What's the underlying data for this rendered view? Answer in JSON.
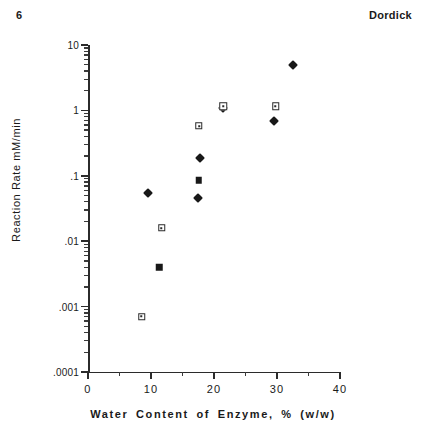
{
  "header": {
    "page_number": "6",
    "running_head": "Dordick"
  },
  "chart_data": {
    "type": "scatter",
    "title": "",
    "xlabel": "Water Content of Enzyme, % (w/w)",
    "ylabel": "Reaction Rate  mM/min",
    "xlim": [
      0,
      40
    ],
    "ylim": [
      0.0001,
      10
    ],
    "yscale": "log",
    "xscale": "linear",
    "grid": false,
    "legend": "none",
    "xticks": [
      0,
      10,
      20,
      30,
      40
    ],
    "xtick_labels": [
      "0",
      "10",
      "20",
      "30",
      "40"
    ],
    "xticks_minor": [
      5,
      15,
      25,
      35
    ],
    "yticks": [
      10,
      1,
      0.1,
      0.01,
      0.001,
      0.0001
    ],
    "ytick_labels": [
      "10",
      "1",
      ".1",
      ".01",
      ".001",
      ".0001"
    ],
    "series": [
      {
        "name": "filled-diamond",
        "marker": "filled-diamond",
        "points": [
          {
            "x": 9.5,
            "y": 0.055
          },
          {
            "x": 17.5,
            "y": 0.045
          },
          {
            "x": 17.8,
            "y": 0.19
          },
          {
            "x": 21.4,
            "y": 1.1
          },
          {
            "x": 29.5,
            "y": 0.68
          },
          {
            "x": 32.5,
            "y": 5.0
          }
        ]
      },
      {
        "name": "filled-square",
        "marker": "filled-square",
        "points": [
          {
            "x": 11.3,
            "y": 0.004
          },
          {
            "x": 17.6,
            "y": 0.085
          },
          {
            "x": 21.5,
            "y": 1.15
          }
        ]
      },
      {
        "name": "open-square",
        "marker": "open-square",
        "points": [
          {
            "x": 8.5,
            "y": 0.0007
          },
          {
            "x": 11.7,
            "y": 0.016
          },
          {
            "x": 17.6,
            "y": 0.58
          },
          {
            "x": 21.5,
            "y": 1.15
          },
          {
            "x": 29.8,
            "y": 1.15
          }
        ]
      }
    ]
  }
}
